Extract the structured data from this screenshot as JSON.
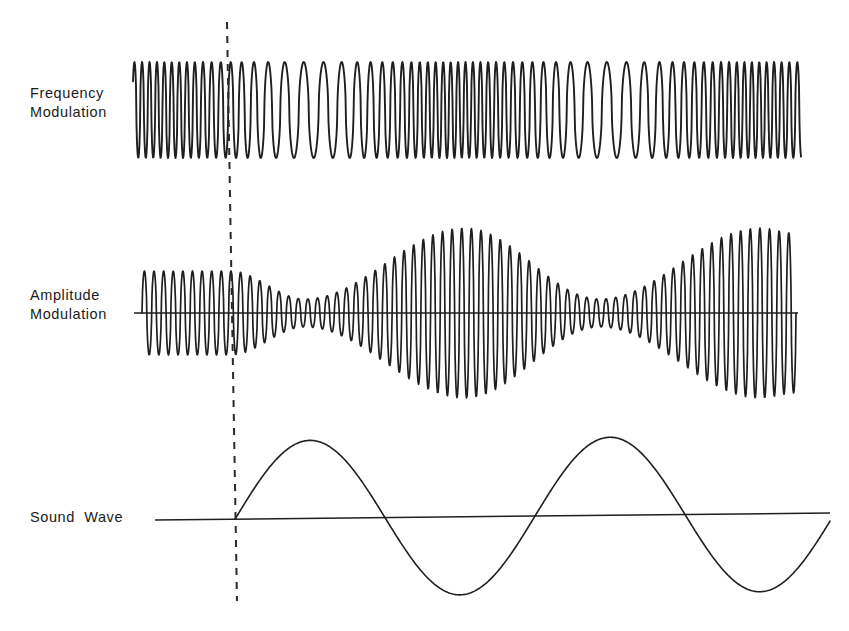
{
  "figure": {
    "background_color": "#ffffff",
    "ink_color": "#1f1f1f",
    "width": 849,
    "height": 631
  },
  "labels": {
    "frequency_modulation": "Frequency\nModulation",
    "amplitude_modulation": "Amplitude\nModulation",
    "sound_wave": "Sound  Wave"
  },
  "marker": {
    "name": "reference-dashed-line",
    "x_top": 227,
    "x_bottom": 237,
    "y_top": 22,
    "y_bottom": 601,
    "style": "dashed",
    "dash_pattern": "7 7",
    "color": "#2a2a2a",
    "width": 2
  },
  "chart_data": [
    {
      "type": "line",
      "name": "frequency-modulation-trace",
      "title": "Frequency Modulation",
      "xlabel": "",
      "ylabel": "",
      "x_start": 133,
      "x_end": 801,
      "baseline_y": 110,
      "amplitude": 48,
      "top_y": 62,
      "bottom_y": 158,
      "carrier_cycles": 62,
      "description": "Constant-amplitude carrier whose instantaneous frequency follows the sound wave: slowest (widest spacing) at the sound-wave crest near x=310 and x=605, fastest (densest) at the sound-wave trough near x=460 and x=752.",
      "freq_min_hz_rel": 0.55,
      "freq_max_hz_rel": 1.9,
      "modulation_index": 0.46,
      "modulation_periods": 2.0
    },
    {
      "type": "line",
      "name": "amplitude-modulation-trace",
      "title": "Amplitude Modulation",
      "xlabel": "",
      "ylabel": "",
      "x_start": 142,
      "x_end": 796,
      "baseline_y": 313,
      "carrier_cycles": 68,
      "envelope_max": 85,
      "envelope_min": 14,
      "envelope_description": "Envelope proportional to the sound wave: constant level before the dashed reference line, waist (minimum) near x=305, maximum near x=465, second waist near x=600, second maximum near x=760.",
      "envelope_nodes": [
        {
          "x": 142,
          "amp": 42
        },
        {
          "x": 230,
          "amp": 42
        },
        {
          "x": 305,
          "amp": 14
        },
        {
          "x": 465,
          "amp": 85
        },
        {
          "x": 600,
          "amp": 14
        },
        {
          "x": 760,
          "amp": 85
        },
        {
          "x": 796,
          "amp": 80
        }
      ]
    },
    {
      "type": "line",
      "name": "sound-wave-trace",
      "title": "Sound Wave",
      "xlabel": "",
      "ylabel": "",
      "x_start": 155,
      "x_end": 830,
      "baseline_y_left": 520,
      "baseline_y_right": 513,
      "amplitude": 78,
      "period_px": 300,
      "cycles": 2,
      "wave_start_x": 235,
      "key_points": [
        {
          "x": 235,
          "y": 518,
          "kind": "zero-rising"
        },
        {
          "x": 310,
          "y": 440,
          "kind": "crest"
        },
        {
          "x": 385,
          "y": 517,
          "kind": "zero-falling"
        },
        {
          "x": 460,
          "y": 594,
          "kind": "trough"
        },
        {
          "x": 535,
          "y": 516,
          "kind": "zero-rising"
        },
        {
          "x": 605,
          "y": 438,
          "kind": "crest"
        },
        {
          "x": 677,
          "y": 515,
          "kind": "zero-falling"
        },
        {
          "x": 752,
          "y": 592,
          "kind": "trough"
        },
        {
          "x": 828,
          "y": 513,
          "kind": "zero-rising"
        }
      ]
    }
  ]
}
